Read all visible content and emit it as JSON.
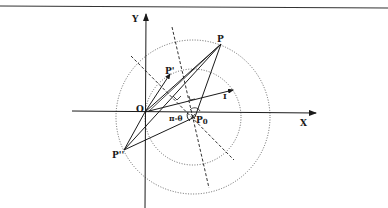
{
  "figure": {
    "type": "geometric-diagram",
    "colors": {
      "ink": "#1a1a1a",
      "background": "#ffffff",
      "dotted": "#555555"
    },
    "axes": {
      "x_label": "X",
      "y_label": "Y"
    },
    "points": {
      "origin": "O",
      "p": "P",
      "p_prime": "P'",
      "p_double_prime": "P''",
      "p0": "P",
      "p0_sub": "0",
      "i": "I"
    },
    "angle_label": "π-θ",
    "circles": [
      {
        "name": "outer-circle",
        "style": "dotted"
      },
      {
        "name": "inner-circle",
        "style": "dotted"
      }
    ],
    "lines": [
      {
        "name": "dashed-bisector-1",
        "style": "dashed"
      },
      {
        "name": "dashed-bisector-2",
        "style": "dashed"
      }
    ]
  }
}
